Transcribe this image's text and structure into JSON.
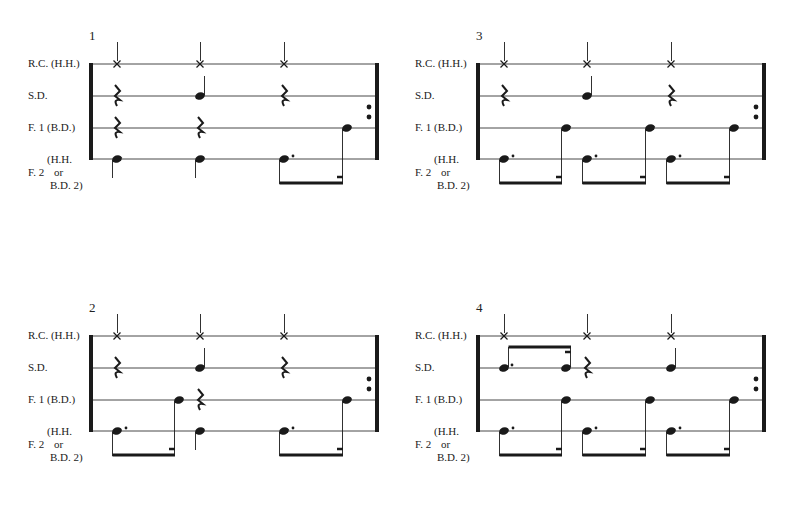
{
  "labels": {
    "rc": "R.C. (H.H.)",
    "sd": "S.D.",
    "f1": "F. 1 (B.D.)",
    "f2_a": "(H.H.",
    "f2_b": "F. 2",
    "f2_c": "or",
    "f2_d": "B.D. 2)"
  },
  "panels": [
    {
      "number": "1",
      "ox": 0,
      "oy": 0,
      "rc": [
        "x",
        "x",
        "x"
      ],
      "sd": [
        "rest",
        "note",
        "rest"
      ],
      "f1": [
        "rest",
        "rest",
        "16th"
      ],
      "f2": [
        "quarter",
        "quarter",
        "dotted8-group"
      ]
    },
    {
      "number": "3",
      "ox": 387,
      "oy": 0,
      "rc": [
        "x",
        "x",
        "x"
      ],
      "sd": [
        "rest",
        "note",
        "rest"
      ],
      "f1": [
        "16th",
        "16th",
        "16th"
      ],
      "f2": [
        "dotted8-group",
        "dotted8-group",
        "dotted8-group"
      ]
    },
    {
      "number": "2",
      "ox": 0,
      "oy": 272,
      "rc": [
        "x",
        "x",
        "x"
      ],
      "sd": [
        "rest",
        "note",
        "rest"
      ],
      "f1": [
        "16th",
        "rest",
        "16th"
      ],
      "f2": [
        "dotted8-group",
        "quarter",
        "dotted8-group"
      ]
    },
    {
      "number": "4",
      "ox": 387,
      "oy": 272,
      "rc": [
        "x",
        "x",
        "x"
      ],
      "sd": [
        "dotted8-16th-up",
        "rest",
        "note"
      ],
      "f1": [
        "16th",
        "16th",
        "16th"
      ],
      "f2": [
        "dotted8-group",
        "dotted8-group",
        "dotted8-group"
      ]
    }
  ]
}
